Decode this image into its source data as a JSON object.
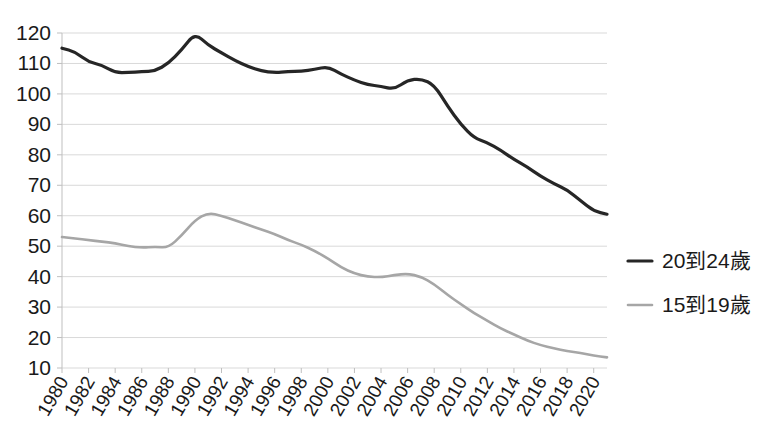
{
  "chart_data": {
    "type": "line",
    "title": "",
    "xlabel": "",
    "ylabel": "",
    "ylim": [
      10,
      120
    ],
    "ytick_step": 10,
    "ytick_labels": [
      "120",
      "110",
      "100",
      "90",
      "80",
      "70",
      "60",
      "50",
      "40",
      "30",
      "20",
      "10"
    ],
    "grid": "horizontal",
    "legend_position": "right",
    "x": [
      1980,
      1981,
      1982,
      1983,
      1984,
      1985,
      1986,
      1987,
      1988,
      1989,
      1990,
      1991,
      1992,
      1993,
      1994,
      1995,
      1996,
      1997,
      1998,
      1999,
      2000,
      2001,
      2002,
      2003,
      2004,
      2005,
      2006,
      2007,
      2008,
      2009,
      2010,
      2011,
      2012,
      2013,
      2014,
      2015,
      2016,
      2017,
      2018,
      2019,
      2020,
      2021
    ],
    "xtick_labels": [
      "1980",
      "1982",
      "1984",
      "1986",
      "1988",
      "1990",
      "1992",
      "1994",
      "1996",
      "1998",
      "2000",
      "2002",
      "2004",
      "2006",
      "2008",
      "2010",
      "2012",
      "2014",
      "2016",
      "2018",
      "2020"
    ],
    "xtick_values": [
      1980,
      1982,
      1984,
      1986,
      1988,
      1990,
      1992,
      1994,
      1996,
      1998,
      2000,
      2002,
      2004,
      2006,
      2008,
      2010,
      2012,
      2014,
      2016,
      2018,
      2020
    ],
    "series": [
      {
        "name": "20到24歲",
        "color": "#262626",
        "width": 3.2,
        "values": [
          115.0,
          113.8,
          110.5,
          109.5,
          107.0,
          107.0,
          107.3,
          107.5,
          110.0,
          114.5,
          120.0,
          116.0,
          113.5,
          111.0,
          109.0,
          107.5,
          107.0,
          107.3,
          107.5,
          108.0,
          109.0,
          106.5,
          104.5,
          103.0,
          102.5,
          101.5,
          104.5,
          105.0,
          103.0,
          96.0,
          90.0,
          85.5,
          84.0,
          81.5,
          78.5,
          76.0,
          73.0,
          70.5,
          68.5,
          65.0,
          61.5,
          60.5
        ]
      },
      {
        "name": "15到19歲",
        "color": "#a6a6a6",
        "width": 2.6,
        "values": [
          53.0,
          52.5,
          52.0,
          51.5,
          51.0,
          50.0,
          49.5,
          49.8,
          49.5,
          53.5,
          58.5,
          61.0,
          60.0,
          58.5,
          57.0,
          55.5,
          54.0,
          52.0,
          50.5,
          48.5,
          46.0,
          43.0,
          41.0,
          40.0,
          39.8,
          40.5,
          41.0,
          40.0,
          37.5,
          34.0,
          31.0,
          28.0,
          25.5,
          23.0,
          21.0,
          19.0,
          17.5,
          16.5,
          15.5,
          15.0,
          14.0,
          13.5
        ]
      }
    ]
  },
  "legend": {
    "items": [
      {
        "label": "20到24歲",
        "color": "#262626",
        "marker": "dash-icon"
      },
      {
        "label": "15到19歲",
        "color": "#a6a6a6",
        "marker": "dash-icon"
      }
    ]
  }
}
